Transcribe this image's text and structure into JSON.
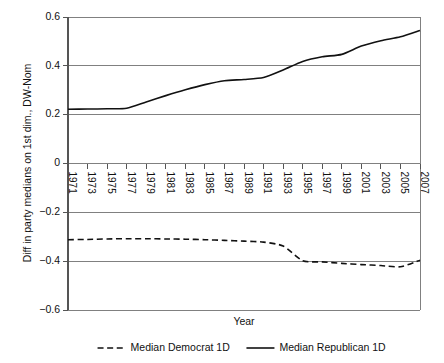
{
  "chart_data": {
    "type": "line",
    "title": "",
    "xlabel": "Year",
    "ylabel": "Diff in party medians on 1st dim., DW-Nom",
    "x": [
      1971,
      1973,
      1975,
      1977,
      1979,
      1981,
      1983,
      1985,
      1987,
      1989,
      1991,
      1993,
      1995,
      1997,
      1999,
      2001,
      2003,
      2005,
      2007
    ],
    "xtick_labels": [
      "1971",
      "1973",
      "1975",
      "1977",
      "1979",
      "1981",
      "1983",
      "1985",
      "1987",
      "1989",
      "1991",
      "1993",
      "1995",
      "1997",
      "1999",
      "2001",
      "2003",
      "2005",
      "2007"
    ],
    "ytick_labels": [
      "0.6",
      "0.4",
      "0.2",
      "0",
      "-0.2",
      "-0.4",
      "-0.6"
    ],
    "ytick_values": [
      0.6,
      0.4,
      0.2,
      0,
      -0.2,
      -0.4,
      -0.6
    ],
    "xlim": [
      1971,
      2007
    ],
    "ylim": [
      -0.6,
      0.6
    ],
    "grid": "horizontal",
    "legend_position": "bottom",
    "series": [
      {
        "name": "Median Democrat 1D",
        "style": "dashed",
        "color": "#111111",
        "values": [
          -0.312,
          -0.311,
          -0.309,
          -0.308,
          -0.308,
          -0.309,
          -0.31,
          -0.312,
          -0.315,
          -0.318,
          -0.322,
          -0.338,
          -0.398,
          -0.403,
          -0.409,
          -0.414,
          -0.418,
          -0.423,
          -0.396
        ]
      },
      {
        "name": "Median Republican 1D",
        "style": "solid",
        "color": "#111111",
        "values": [
          0.222,
          0.223,
          0.224,
          0.226,
          0.252,
          0.278,
          0.302,
          0.323,
          0.339,
          0.344,
          0.352,
          0.383,
          0.418,
          0.437,
          0.447,
          0.481,
          0.503,
          0.519,
          0.545
        ]
      }
    ]
  },
  "legend": {
    "items": [
      {
        "label": "Median Democrat 1D",
        "style": "dashed"
      },
      {
        "label": "Median Republican 1D",
        "style": "solid"
      }
    ]
  },
  "axes": {
    "x_title": "Year",
    "y_title": "Diff in party medians on 1st dim., DW-Nom"
  }
}
